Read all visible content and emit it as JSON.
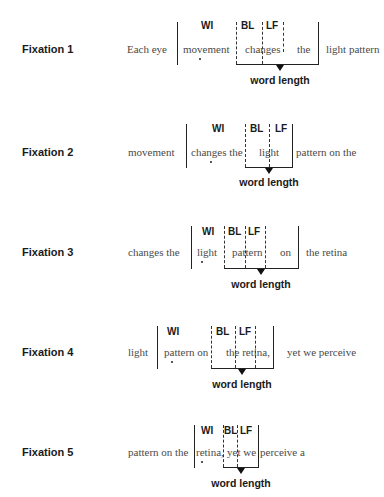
{
  "headers": {
    "wi": "WI",
    "bl": "BL",
    "lf": "LF"
  },
  "word_length_label": "word length",
  "fixations": [
    {
      "label": "Fixation 1",
      "before": "Each eye",
      "wi_text": "movement",
      "window_text": "changes",
      "extra_text": "the",
      "after": "light pattern"
    },
    {
      "label": "Fixation 2",
      "before": "movement",
      "wi_text": "changes the",
      "window_text": "light",
      "extra_text": "",
      "after": "pattern on the"
    },
    {
      "label": "Fixation 3",
      "before": "changes the",
      "wi_text": "light",
      "window_text": "pattern",
      "extra_text": "on",
      "after": "the retina"
    },
    {
      "label": "Fixation 4",
      "before": "light",
      "wi_text": "pattern on",
      "window_text": "the retina,",
      "extra_text": "",
      "after": "yet we perceive"
    },
    {
      "label": "Fixation 5",
      "before": "pattern on the",
      "wi_text": "retina,",
      "window_text": "yet we",
      "extra_text": "",
      "after": "perceive a"
    }
  ],
  "colors": {
    "text": "#4a4a4a",
    "label": "#1a1a1a",
    "lines": "#222222"
  }
}
